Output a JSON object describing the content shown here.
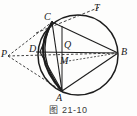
{
  "figure": {
    "caption": "图 21-10",
    "stroke_color": "#1d1d1d",
    "label_color": "#1a1a1a",
    "background_color": "#fdfdfc"
  },
  "points": [
    {
      "id": "T",
      "label": "T",
      "x": 97,
      "y": 9,
      "label_x": 94,
      "label_y": 3,
      "role": "tangent-endpoint"
    },
    {
      "id": "C",
      "label": "C",
      "x": 52,
      "y": 22,
      "label_x": 44,
      "label_y": 12,
      "role": "circle-point"
    },
    {
      "id": "B",
      "label": "B",
      "x": 118,
      "y": 53,
      "label_x": 121,
      "label_y": 47,
      "role": "circle-point"
    },
    {
      "id": "P",
      "label": "P",
      "x": 8,
      "y": 56,
      "label_x": 1,
      "label_y": 49,
      "role": "external-point"
    },
    {
      "id": "D",
      "label": "D",
      "x": 40,
      "y": 52,
      "label_x": 29,
      "label_y": 44,
      "role": "intersection-point"
    },
    {
      "id": "Q",
      "label": "Q",
      "x": 62,
      "y": 52,
      "label_x": 64,
      "label_y": 40,
      "role": "intersection-point"
    },
    {
      "id": "M",
      "label": "M",
      "x": 62,
      "y": 62,
      "label_x": 60,
      "label_y": 56,
      "role": "interior-point"
    },
    {
      "id": "A",
      "label": "A",
      "x": 62,
      "y": 91,
      "label_x": 56,
      "label_y": 93,
      "role": "circle-point"
    }
  ],
  "circle": {
    "cx": 78,
    "cy": 55,
    "r": 40,
    "style": "solid"
  },
  "arc_cda": {
    "from": "C",
    "to": "A",
    "through": "D",
    "style": "solid-thick"
  },
  "solid_segments": [
    {
      "from": "C",
      "to": "A",
      "name": "chord-CA"
    },
    {
      "from": "C",
      "to": "B",
      "name": "chord-CB"
    },
    {
      "from": "A",
      "to": "B",
      "name": "chord-AB"
    },
    {
      "from": "D",
      "to": "B",
      "name": "segment-DB"
    },
    {
      "from": "C",
      "to": "D",
      "name": "segment-CD"
    },
    {
      "from": "D",
      "to": "A",
      "name": "segment-DA"
    }
  ],
  "dashed_segments": [
    {
      "from": "P",
      "to": "C",
      "name": "secant-PC"
    },
    {
      "from": "P",
      "to": "B",
      "name": "secant-PB"
    },
    {
      "from": "P",
      "to": "A",
      "name": "secant-PA"
    },
    {
      "from": "C",
      "to": "T",
      "name": "tangent-CT"
    },
    {
      "from": "M",
      "to": "B",
      "name": "segment-MB"
    }
  ]
}
